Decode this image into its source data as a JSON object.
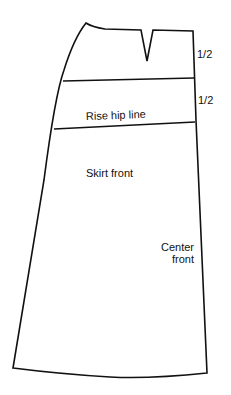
{
  "diagram": {
    "labels": {
      "measure_top": "1/2",
      "measure_second": "1/2",
      "rise_hip_line": "Rise hip line",
      "skirt_front": "Skirt front",
      "center_front_line1": "Center",
      "center_front_line2": "front"
    },
    "colors": {
      "stroke": "#111111",
      "background": "#ffffff"
    }
  }
}
